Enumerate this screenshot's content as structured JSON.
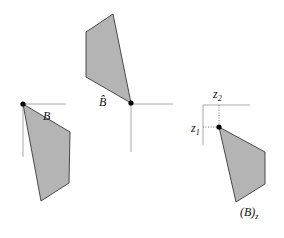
{
  "figure": {
    "panels": [
      {
        "id": "B",
        "label": "B",
        "origin": [
          23,
          104
        ],
        "polygon": [
          [
            23,
            104
          ],
          [
            70,
            132
          ],
          [
            69,
            183
          ],
          [
            41,
            201
          ]
        ],
        "axes": {
          "h_end": [
            66,
            104
          ],
          "v_end": [
            23,
            157
          ]
        },
        "label_pos": [
          43,
          119
        ]
      },
      {
        "id": "B-hat",
        "label": "B̂",
        "origin": [
          131,
          103
        ],
        "polygon": [
          [
            113,
            14
          ],
          [
            86,
            32
          ],
          [
            86,
            77
          ],
          [
            131,
            103
          ]
        ],
        "axes": {
          "h_end": [
            173,
            104
          ],
          "v_end": [
            131,
            152
          ]
        },
        "label_pos": [
          99,
          105
        ]
      },
      {
        "id": "B-z",
        "label_main": "(B)",
        "label_sub": "z",
        "origin": [
          219,
          127
        ],
        "polygon": [
          [
            219,
            127
          ],
          [
            265,
            152
          ],
          [
            265,
            184
          ],
          [
            236,
            202
          ]
        ],
        "axes": {
          "corner": [
            203,
            105
          ],
          "h_end": [
            250,
            105
          ],
          "v_end": [
            203,
            145
          ]
        },
        "z1_label": "z",
        "z1_sub": "1",
        "z2_label": "z",
        "z2_sub": "2"
      }
    ],
    "colors": {
      "fill": "#b4b4b4",
      "edge": "#4a4a4a",
      "axis": "#a8a8a8",
      "point": "#000000"
    }
  }
}
